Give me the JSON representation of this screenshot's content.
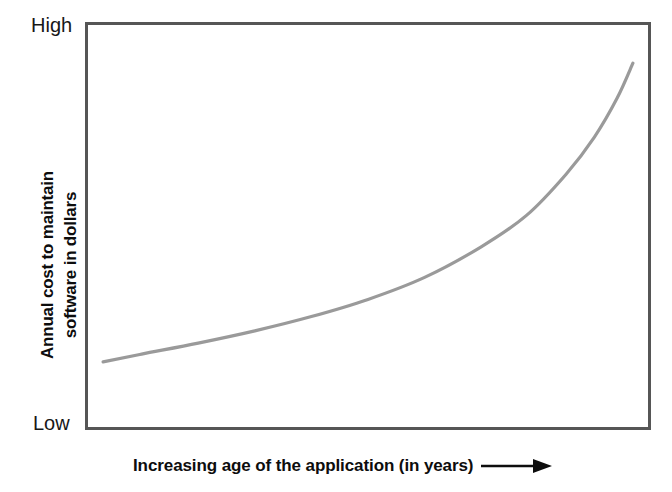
{
  "figure": {
    "background_color": "#ffffff",
    "frame_color": "#565656",
    "curve_color": "#9a9a9a"
  },
  "axes": {
    "y_title_line1": "Annual cost to maintain",
    "y_title_line2": "software in dollars",
    "y_tick_high": "High",
    "y_tick_low": "Low",
    "x_title": "Increasing age of the application (in years)",
    "x_arrow_icon": "right-arrow-icon"
  },
  "chart_data": {
    "type": "line",
    "title": "",
    "xlabel": "Increasing age of the application (in years)",
    "ylabel": "Annual cost to maintain software in dollars",
    "xlim": [
      0,
      100
    ],
    "ylim": [
      0,
      100
    ],
    "xticks": [],
    "yticks": [
      "Low",
      "High"
    ],
    "ytick_labels": [
      "Low",
      "High"
    ],
    "grid": false,
    "legend": null,
    "legend_position": "none",
    "annotations": [],
    "series": [
      {
        "name": "Annual maintenance cost",
        "color": "#9a9a9a",
        "x": [
          3.2,
          10,
          20,
          30,
          40,
          50,
          60,
          70,
          78,
          85,
          90,
          94,
          96.8
        ],
        "y": [
          16.7,
          18.6,
          21.3,
          24.3,
          27.8,
          32.0,
          37.4,
          44.9,
          52.6,
          62.7,
          71.8,
          81.3,
          89.9
        ]
      }
    ]
  }
}
